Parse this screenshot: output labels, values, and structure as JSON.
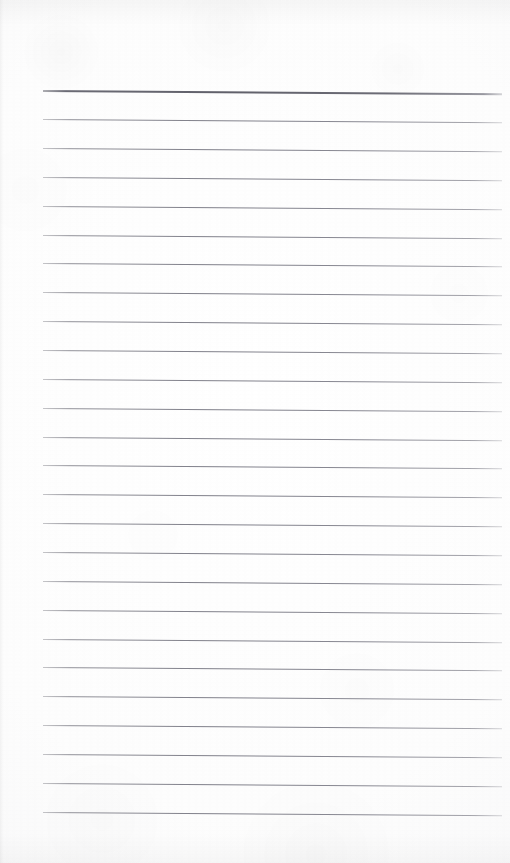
{
  "document": {
    "kind": "scanned-blank-ruled-notepad-page",
    "page_width": 510,
    "page_height": 863,
    "background_color": "#fdfdfd",
    "has_text_content": false,
    "text_content": "",
    "caption": ""
  },
  "ruling": {
    "line_color": "#84848e",
    "header_line_color": "#60606a",
    "line_left_x": 43,
    "line_right_x": 502,
    "first_line_y": 90,
    "last_line_y": 812,
    "line_spacing": 28.9,
    "line_thickness": 1,
    "header_line_thickness": 2,
    "line_count": 26,
    "slant_degrees": 0.42,
    "lines": [
      {
        "index": 1,
        "y": 90,
        "emphasis": "header"
      },
      {
        "index": 2,
        "y": 119,
        "emphasis": "normal"
      },
      {
        "index": 3,
        "y": 148,
        "emphasis": "normal"
      },
      {
        "index": 4,
        "y": 177,
        "emphasis": "normal"
      },
      {
        "index": 5,
        "y": 206,
        "emphasis": "normal"
      },
      {
        "index": 6,
        "y": 235,
        "emphasis": "normal"
      },
      {
        "index": 7,
        "y": 263,
        "emphasis": "normal"
      },
      {
        "index": 8,
        "y": 292,
        "emphasis": "normal"
      },
      {
        "index": 9,
        "y": 321,
        "emphasis": "normal"
      },
      {
        "index": 10,
        "y": 350,
        "emphasis": "normal"
      },
      {
        "index": 11,
        "y": 379,
        "emphasis": "normal"
      },
      {
        "index": 12,
        "y": 408,
        "emphasis": "normal"
      },
      {
        "index": 13,
        "y": 437,
        "emphasis": "normal"
      },
      {
        "index": 14,
        "y": 465,
        "emphasis": "normal"
      },
      {
        "index": 15,
        "y": 494,
        "emphasis": "normal"
      },
      {
        "index": 16,
        "y": 523,
        "emphasis": "normal"
      },
      {
        "index": 17,
        "y": 552,
        "emphasis": "normal"
      },
      {
        "index": 18,
        "y": 581,
        "emphasis": "normal"
      },
      {
        "index": 19,
        "y": 610,
        "emphasis": "normal"
      },
      {
        "index": 20,
        "y": 639,
        "emphasis": "normal"
      },
      {
        "index": 21,
        "y": 667,
        "emphasis": "normal"
      },
      {
        "index": 22,
        "y": 696,
        "emphasis": "normal"
      },
      {
        "index": 23,
        "y": 725,
        "emphasis": "normal"
      },
      {
        "index": 24,
        "y": 754,
        "emphasis": "normal"
      },
      {
        "index": 25,
        "y": 783,
        "emphasis": "normal"
      },
      {
        "index": 26,
        "y": 812,
        "emphasis": "normal"
      }
    ]
  },
  "margins": {
    "top_blank_height": 90,
    "bottom_blank_height": 51,
    "left_blank_width": 43,
    "right_blank_width": 8
  }
}
